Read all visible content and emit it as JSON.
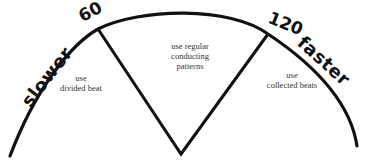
{
  "diagram": {
    "stroke_color": "#111111",
    "ticks": [
      {
        "label": "60"
      },
      {
        "label": "120"
      }
    ],
    "direction_labels": {
      "left": "slower",
      "right": "faster"
    },
    "regions": [
      {
        "id": "left",
        "text": "use\ndivided beat"
      },
      {
        "id": "middle",
        "text": "use regular\nconducting\npatterns"
      },
      {
        "id": "right",
        "text": "use\ncollected beats"
      }
    ]
  }
}
